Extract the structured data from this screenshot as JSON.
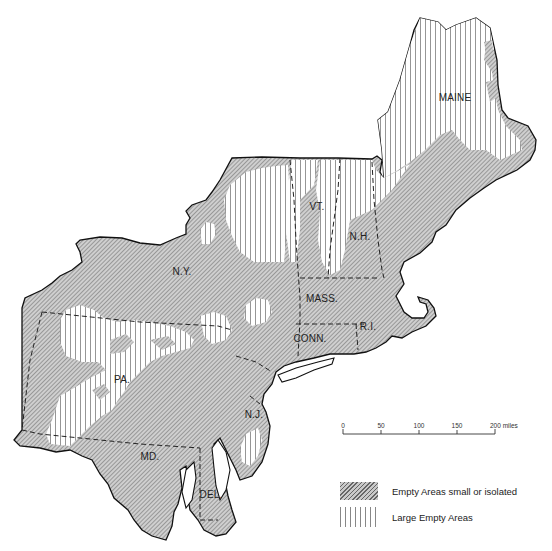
{
  "map": {
    "region": "Northeastern United States",
    "states": [
      {
        "key": "maine",
        "label": "MAINE",
        "x": 455,
        "y": 101
      },
      {
        "key": "vt",
        "label": "VT.",
        "x": 317,
        "y": 210
      },
      {
        "key": "nh",
        "label": "N.H.",
        "x": 360,
        "y": 240
      },
      {
        "key": "ny",
        "label": "N.Y.",
        "x": 178,
        "y": 275
      },
      {
        "key": "mass",
        "label": "MASS.",
        "x": 320,
        "y": 302
      },
      {
        "key": "conn",
        "label": "CONN.",
        "x": 308,
        "y": 340
      },
      {
        "key": "ri",
        "label": "R.I.",
        "x": 365,
        "y": 329
      },
      {
        "key": "pa",
        "label": "PA.",
        "x": 118,
        "y": 383
      },
      {
        "key": "nj",
        "label": "N.J.",
        "x": 255,
        "y": 416
      },
      {
        "key": "md",
        "label": "MD.",
        "x": 147,
        "y": 458
      },
      {
        "key": "del",
        "label": "DEL.",
        "x": 208,
        "y": 496
      }
    ]
  },
  "scale_bar": {
    "ticks": [
      "0",
      "50",
      "100",
      "150",
      "200 miles"
    ],
    "unit": "miles"
  },
  "legend": {
    "items": [
      {
        "pattern": "diagonal-hatch",
        "label": "Empty Areas small or isolated"
      },
      {
        "pattern": "vertical-lines",
        "label": "Large Empty Areas"
      }
    ]
  },
  "colors": {
    "hatch_dark": "#666666",
    "hatch_light": "#c9c9c9",
    "outline": "#111111",
    "background": "#ffffff"
  }
}
